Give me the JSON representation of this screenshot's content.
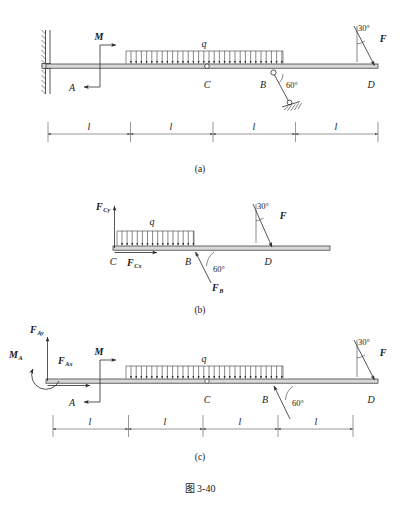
{
  "figure": {
    "caption": "图 3-40",
    "panels": [
      {
        "id": "a",
        "caption": "(a)",
        "description": "Original compound beam system with fixed support at A, couple M, distributed load q, pin at C, link at B inclined 60 degrees, and force F at D inclined 30 degrees from vertical",
        "labels": {
          "support_a": "A",
          "moment": "M",
          "load": "q",
          "hinge_c": "C",
          "joint_b": "B",
          "end_d": "D",
          "force_f": "F",
          "angle_link": "60°",
          "angle_force": "30°"
        },
        "dimensions": [
          "l",
          "l",
          "l",
          "l"
        ]
      },
      {
        "id": "b",
        "caption": "(b)",
        "description": "Free body diagram of segment CD showing reactions at C, link force at B and applied force F at D",
        "labels": {
          "force_cy": "F",
          "force_cy_sub": "Cy",
          "force_cx": "F",
          "force_cx_sub": "Cx",
          "load": "q",
          "point_c": "C",
          "point_b": "B",
          "point_d": "D",
          "force_b": "F",
          "force_b_sub": "B",
          "force_f": "F",
          "angle_link": "60°",
          "angle_force": "30°"
        }
      },
      {
        "id": "c",
        "caption": "(c)",
        "description": "Free body diagram of the whole beam showing fixed-end reactions at A, couple M, distributed load q, link force at B and force F at D",
        "labels": {
          "moment_a": "M",
          "moment_a_sub": "A",
          "force_ay": "F",
          "force_ay_sub": "Ay",
          "force_ax": "F",
          "force_ax_sub": "Ax",
          "support_a": "A",
          "moment": "M",
          "load": "q",
          "hinge_c": "C",
          "joint_b": "B",
          "end_d": "D",
          "force_f": "F",
          "angle_link": "60°",
          "angle_force": "30°"
        },
        "dimensions": [
          "l",
          "l",
          "l",
          "l"
        ]
      }
    ]
  },
  "colors": {
    "stroke": "#2b2b2b",
    "beam_fill": "#d8d8d8",
    "dimension": "#555555",
    "background": "#ffffff"
  }
}
